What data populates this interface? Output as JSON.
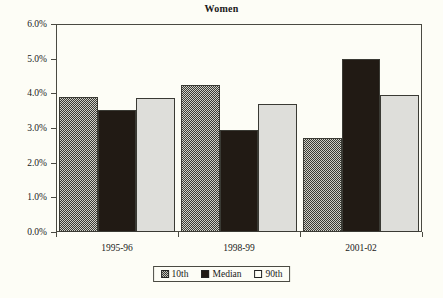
{
  "chart_data": {
    "type": "bar",
    "title": "Women",
    "xlabel": "",
    "ylabel": "",
    "ylim": [
      0,
      6
    ],
    "ytick_labels": [
      "0.0%",
      "1.0%",
      "2.0%",
      "3.0%",
      "4.0%",
      "5.0%",
      "6.0%"
    ],
    "ytick_values": [
      0,
      1,
      2,
      3,
      4,
      5,
      6
    ],
    "grid": false,
    "legend_position": "bottom",
    "categories": [
      "1995-96",
      "1998-99",
      "2001-02"
    ],
    "series": [
      {
        "name": "10th",
        "values": [
          3.9,
          4.25,
          2.7
        ],
        "fill": "hatched-gray"
      },
      {
        "name": "Median",
        "values": [
          3.53,
          2.95,
          5.0
        ],
        "fill": "black"
      },
      {
        "name": "90th",
        "values": [
          3.88,
          3.7,
          3.95
        ],
        "fill": "light-gray"
      }
    ]
  },
  "legend": {
    "items": [
      {
        "label": "10th",
        "swatch": "hatched-gray-swatch"
      },
      {
        "label": "Median",
        "swatch": "black-swatch"
      },
      {
        "label": "90th",
        "swatch": "white-swatch"
      }
    ]
  },
  "colors": {
    "background": "#fdfdf6",
    "axis": "#4a4a42",
    "text": "#1a1a1a",
    "series_10th": "#cfcfc8",
    "series_median": "#211a14",
    "series_90th": "#dededa"
  }
}
